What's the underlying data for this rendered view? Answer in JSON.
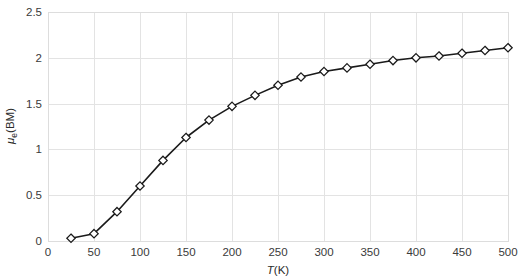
{
  "chart_data": {
    "type": "line",
    "title": "",
    "subtitle": "",
    "xlabel": "T(K)",
    "ylabel": "μ_e (BM)",
    "ylabel_main": "μ",
    "ylabel_sub": "e",
    "ylabel_unit": "(BM)",
    "xlabel_symbol": "T",
    "xlabel_unit": "(K)",
    "xlim": [
      0,
      500
    ],
    "ylim": [
      0,
      2.5
    ],
    "xticks": [
      0,
      50,
      100,
      150,
      200,
      250,
      300,
      350,
      400,
      450,
      500
    ],
    "xticklabels": [
      "0",
      "50",
      "100",
      "150",
      "200",
      "250",
      "300",
      "350",
      "400",
      "450",
      "500"
    ],
    "yticks": [
      0,
      0.5,
      1,
      1.5,
      2,
      2.5
    ],
    "yticklabels": [
      "0",
      "0.5",
      "1",
      "1.5",
      "2",
      "2.5"
    ],
    "grid": true,
    "legend": "none",
    "marker": "diamond",
    "marker_fill": "#ffffff",
    "marker_edge_color": "#1a1a1a",
    "line_color": "#1a1a1a",
    "grid_color": "#e3e3e3",
    "background_color": "#ffffff",
    "series": [
      {
        "name": "mu_eff",
        "x": [
          25,
          50,
          75,
          100,
          125,
          150,
          175,
          200,
          225,
          250,
          275,
          300,
          325,
          350,
          375,
          400,
          425,
          450,
          475,
          500
        ],
        "y": [
          0.03,
          0.08,
          0.32,
          0.6,
          0.88,
          1.13,
          1.32,
          1.47,
          1.59,
          1.7,
          1.79,
          1.85,
          1.89,
          1.93,
          1.97,
          2.0,
          2.02,
          2.05,
          2.08,
          2.11
        ]
      }
    ]
  }
}
